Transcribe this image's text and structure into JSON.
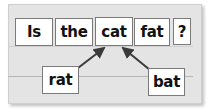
{
  "sentence": {
    "words": [
      "Is",
      "the",
      "cat",
      "fat",
      "?"
    ]
  },
  "options": {
    "left": "rat",
    "right": "bat"
  },
  "colors": {
    "panel": "#e4e4e4",
    "box": "#ffffff",
    "arrow": "#3a3a3a"
  }
}
